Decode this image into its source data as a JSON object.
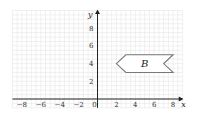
{
  "chart_data": {
    "type": "diagram",
    "title": "",
    "xlabel": "x",
    "ylabel": "y",
    "xlim": [
      -9,
      9
    ],
    "ylim": [
      -1,
      10
    ],
    "x_ticks": [
      "-8",
      "-6",
      "-4",
      "-2",
      "0",
      "2",
      "4",
      "6",
      "8"
    ],
    "y_ticks": [
      "2",
      "4",
      "6",
      "8"
    ],
    "grid": true,
    "shapes": [
      {
        "label": "B",
        "vertices": [
          [
            2,
            4
          ],
          [
            3,
            5
          ],
          [
            8,
            5
          ],
          [
            7,
            4
          ],
          [
            8,
            3
          ],
          [
            3,
            3
          ]
        ],
        "label_pos": [
          5,
          4
        ]
      }
    ]
  }
}
